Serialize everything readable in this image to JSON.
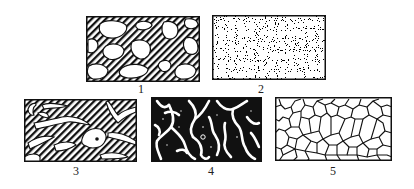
{
  "figure": {
    "type": "microstructure-texture-diagram",
    "panels": [
      {
        "id": 1,
        "label": "1",
        "pattern": "hatched-matrix-with-white-granules"
      },
      {
        "id": 2,
        "label": "2",
        "pattern": "fine-speckled-stipple"
      },
      {
        "id": 3,
        "label": "3",
        "pattern": "hatched-matrix-with-white-vermiform-inclusions"
      },
      {
        "id": 4,
        "label": "4",
        "pattern": "black-matrix-with-white-worm-channels"
      },
      {
        "id": 5,
        "label": "5",
        "pattern": "white-polygonal-cells-with-dark-boundaries"
      }
    ],
    "colors": {
      "ink": "#111111",
      "paper": "#ffffff",
      "label": "#222222"
    }
  }
}
